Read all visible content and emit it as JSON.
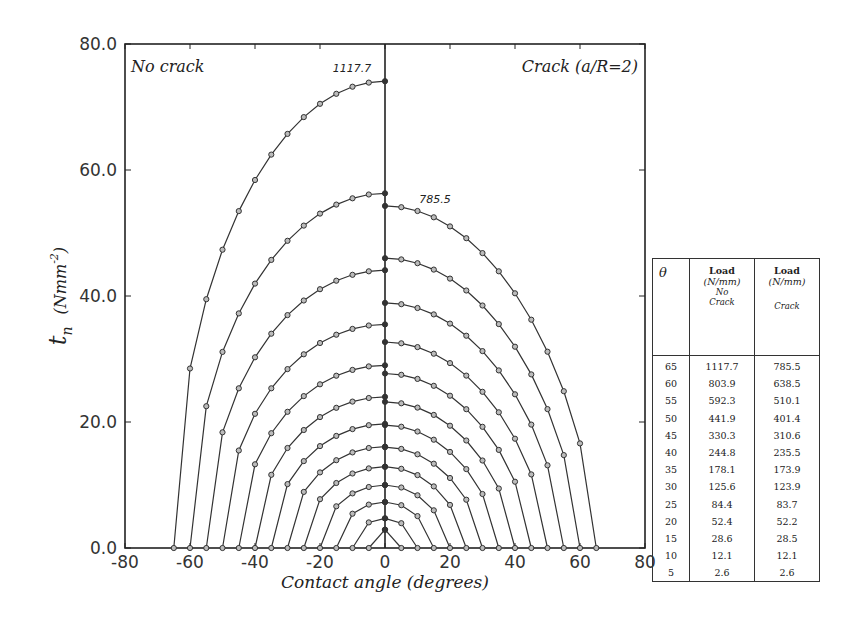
{
  "chart_data": {
    "type": "line",
    "title": "",
    "xlabel": "Contact angle (degrees)",
    "ylabel": "t_n (Nmm^-2)",
    "ylabel_parts": {
      "symbol": "t",
      "subscript": "n",
      "units_open": "(Nmm",
      "units_exp": "-2",
      "units_close": ")"
    },
    "xlim": [
      -80,
      80
    ],
    "ylim": [
      0,
      80
    ],
    "xticks": [
      -80,
      -60,
      -40,
      -20,
      0,
      20,
      40,
      60,
      80
    ],
    "xtick_labels": [
      "-80",
      "-60",
      "-40",
      "-20",
      "0",
      "20",
      "40",
      "60",
      "80"
    ],
    "yticks": [
      0,
      20,
      40,
      60,
      80
    ],
    "ytick_labels": [
      "0.0",
      "20.0",
      "40.0",
      "60.0",
      "80.0"
    ],
    "grid": false,
    "legend": null,
    "annotations": [
      {
        "text": "No crack",
        "position": "top-left"
      },
      {
        "text": "Crack (a/R=2)",
        "position": "top-right"
      },
      {
        "text": "1117.7",
        "position": "above left peak of theta=65 curve"
      },
      {
        "text": "785.5",
        "position": "above right peak of theta=65 curve"
      }
    ],
    "point_spacing_deg": 5,
    "series": [
      {
        "theta": 65,
        "no_crack_peak": 74.1,
        "crack_peak": 54.3
      },
      {
        "theta": 60,
        "no_crack_peak": 56.3,
        "crack_peak": 46.0
      },
      {
        "theta": 55,
        "no_crack_peak": 44.1,
        "crack_peak": 38.9
      },
      {
        "theta": 50,
        "no_crack_peak": 35.5,
        "crack_peak": 32.7
      },
      {
        "theta": 45,
        "no_crack_peak": 29.0,
        "crack_peak": 27.7
      },
      {
        "theta": 40,
        "no_crack_peak": 24.0,
        "crack_peak": 23.2
      },
      {
        "theta": 35,
        "no_crack_peak": 19.7,
        "crack_peak": 19.5
      },
      {
        "theta": 30,
        "no_crack_peak": 16.1,
        "crack_peak": 16.0
      },
      {
        "theta": 25,
        "no_crack_peak": 12.9,
        "crack_peak": 12.9
      },
      {
        "theta": 20,
        "no_crack_peak": 10.0,
        "crack_peak": 10.0
      },
      {
        "theta": 15,
        "no_crack_peak": 7.3,
        "crack_peak": 7.3
      },
      {
        "theta": 10,
        "no_crack_peak": 4.7,
        "crack_peak": 4.7
      },
      {
        "theta": 5,
        "no_crack_peak": 2.9,
        "crack_peak": 2.9
      }
    ],
    "shape_exponent": {
      "no_crack": 0.5,
      "crack": 0.62
    }
  },
  "annotations": {
    "left_title": "No crack",
    "right_title": "Crack (a/R=2)",
    "left_peak_label": "1117.7",
    "right_peak_label": "785.5"
  },
  "table": {
    "headers": {
      "theta": "θ",
      "col1_line1": "Load",
      "col1_line2": "(N/mm)",
      "col1_sub1": "No",
      "col1_sub2": "Crack",
      "col2_line1": "Load",
      "col2_line2": "(N/mm)",
      "col2_sub": "Crack"
    },
    "rows": [
      {
        "theta": "65",
        "no_crack": "1117.7",
        "crack": "785.5"
      },
      {
        "theta": "60",
        "no_crack": "803.9",
        "crack": "638.5"
      },
      {
        "theta": "55",
        "no_crack": "592.3",
        "crack": "510.1"
      },
      {
        "theta": "50",
        "no_crack": "441.9",
        "crack": "401.4"
      },
      {
        "theta": "45",
        "no_crack": "330.3",
        "crack": "310.6"
      },
      {
        "theta": "40",
        "no_crack": "244.8",
        "crack": "235.5"
      },
      {
        "theta": "35",
        "no_crack": "178.1",
        "crack": "173.9"
      },
      {
        "theta": "30",
        "no_crack": "125.6",
        "crack": "123.9"
      },
      {
        "theta": "25",
        "no_crack": "84.4",
        "crack": "83.7"
      },
      {
        "theta": "20",
        "no_crack": "52.4",
        "crack": "52.2"
      },
      {
        "theta": "15",
        "no_crack": "28.6",
        "crack": "28.5"
      },
      {
        "theta": "10",
        "no_crack": "12.1",
        "crack": "12.1"
      },
      {
        "theta": "5",
        "no_crack": "2.6",
        "crack": "2.6"
      }
    ]
  }
}
